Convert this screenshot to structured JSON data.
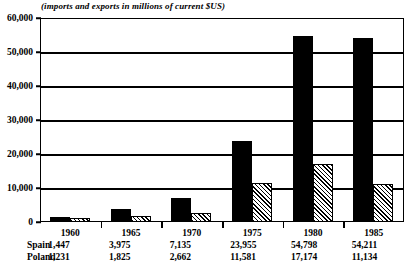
{
  "chart_data": {
    "type": "bar",
    "title": "(imports and exports in millions of current $US)",
    "xlabel": "",
    "ylabel": "",
    "ylim": [
      0,
      60000
    ],
    "yticks": [
      "0",
      "10,000",
      "20,000",
      "30,000",
      "40,000",
      "50,000",
      "60,000"
    ],
    "ytick_values": [
      0,
      10000,
      20000,
      30000,
      40000,
      50000,
      60000
    ],
    "grid": true,
    "legend": "none",
    "categories": [
      "1960",
      "1965",
      "1970",
      "1975",
      "1980",
      "1985"
    ],
    "series": [
      {
        "name": "Spain",
        "fill": "solid-black",
        "values": [
          1447,
          3975,
          7135,
          23955,
          54798,
          54211
        ],
        "labels": [
          "1,447",
          "3,975",
          "7,135",
          "23,955",
          "54,798",
          "54,211"
        ]
      },
      {
        "name": "Poland",
        "fill": "diagonal-hatch",
        "values": [
          1231,
          1825,
          2662,
          11581,
          17174,
          11134
        ],
        "labels": [
          "1,231",
          "1,825",
          "2,662",
          "11,581",
          "17,174",
          "11,134"
        ]
      }
    ]
  },
  "table": {
    "row_labels": [
      "Spain",
      "Poland"
    ]
  },
  "colors": {
    "ink": "#000000",
    "paper": "#ffffff"
  }
}
